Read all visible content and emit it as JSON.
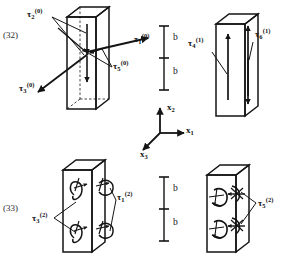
{
  "page": {
    "width": 291,
    "height": 262,
    "background": "#ffffff",
    "ink": "#141414"
  },
  "equation_numbers": [
    {
      "id": "eq-32",
      "text": "(32)",
      "x": 3,
      "y": 30
    },
    {
      "id": "eq-33",
      "text": "(33)",
      "x": 3,
      "y": 203
    }
  ],
  "axes": {
    "name": "coordinate-axes",
    "origin": {
      "x": 160,
      "y": 133
    },
    "labels": {
      "x1": {
        "base": "x",
        "sub": "1",
        "x": 186,
        "y": 115
      },
      "x2": {
        "base": "x",
        "sub": "2",
        "x": 167,
        "y": 103
      },
      "x3": {
        "base": "x",
        "sub": "3",
        "x": 140,
        "y": 150
      }
    }
  },
  "dimension_scales": [
    {
      "id": "dim-scale-top",
      "labels": [
        {
          "text": "b",
          "x": 173,
          "y": 33
        },
        {
          "text": "b",
          "x": 173,
          "y": 67
        }
      ]
    },
    {
      "id": "dim-scale-bottom",
      "labels": [
        {
          "text": "b",
          "x": 173,
          "y": 184
        },
        {
          "text": "b",
          "x": 173,
          "y": 218
        }
      ]
    }
  ],
  "figures": [
    {
      "id": "figure-top-left",
      "equation_ref": "(32)",
      "stress_labels": [
        {
          "id": "tau-2-0",
          "base": "τ",
          "sub": "2",
          "sup": "(0)",
          "x": 27,
          "y": 8
        },
        {
          "id": "tau-1-0",
          "base": "τ",
          "sub": "1",
          "sup": "(0)",
          "x": 134,
          "y": 33
        },
        {
          "id": "tau-5-0",
          "base": "τ",
          "sub": "5",
          "sup": "(0)",
          "x": 113,
          "y": 60
        },
        {
          "id": "tau-3-0",
          "base": "τ",
          "sub": "3",
          "sup": "(0)",
          "x": 19,
          "y": 82
        }
      ]
    },
    {
      "id": "figure-top-right",
      "stress_labels": [
        {
          "id": "tau-4-1",
          "base": "τ",
          "sub": "4",
          "sup": "(1)",
          "x": 188,
          "y": 37
        },
        {
          "id": "tau-6-1",
          "base": "τ",
          "sub": "6",
          "sup": "(1)",
          "x": 255,
          "y": 28
        }
      ]
    },
    {
      "id": "figure-bottom-left",
      "equation_ref": "(33)",
      "stress_labels": [
        {
          "id": "tau-3-2",
          "base": "τ",
          "sub": "3",
          "sup": "(2)",
          "x": 32,
          "y": 212
        },
        {
          "id": "tau-1-2",
          "base": "τ",
          "sub": "1",
          "sup": "(2)",
          "x": 117,
          "y": 191
        }
      ]
    },
    {
      "id": "figure-bottom-right",
      "stress_labels": [
        {
          "id": "tau-5-2",
          "base": "τ",
          "sub": "5",
          "sup": "(2)",
          "x": 258,
          "y": 197
        }
      ]
    }
  ]
}
